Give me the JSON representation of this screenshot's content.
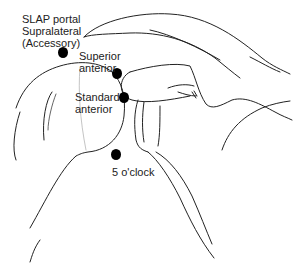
{
  "figure": {
    "type": "anatomical line drawing",
    "labels": {
      "slap_portal": "SLAP portal\nSupralateral\n(Accessory)",
      "superior_anterior": "Superior\nanterior",
      "standard_anterior": "Standard\nanterior",
      "five_oclock": "5 o'clock"
    },
    "portals": [
      {
        "name": "SLAP portal Supralateral (Accessory)",
        "x": 63,
        "y": 52
      },
      {
        "name": "Superior anterior",
        "x": 117,
        "y": 73
      },
      {
        "name": "Standard anterior",
        "x": 124,
        "y": 97
      },
      {
        "name": "5 o'clock",
        "x": 116,
        "y": 154
      }
    ],
    "caption_clipped": true,
    "colors": {
      "line": "#222222",
      "dot": "#000000",
      "background": "#ffffff"
    }
  }
}
